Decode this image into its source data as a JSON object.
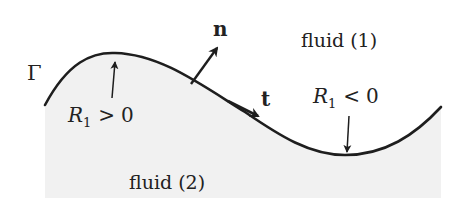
{
  "diagram": {
    "type": "interface-between-two-fluids",
    "colors": {
      "background": "#ffffff",
      "fluid2_fill": "#f1f1f1",
      "curve": "#1e1e1e",
      "text": "#222222"
    },
    "interface": {
      "label": "Γ"
    },
    "regions": {
      "upper": {
        "label": "fluid (1)"
      },
      "lower": {
        "label": "fluid (2)"
      }
    },
    "vectors": {
      "normal": {
        "label": "n"
      },
      "tangent": {
        "label": "t"
      }
    },
    "curvature": {
      "positive": {
        "symbol": "R",
        "subscript": "1",
        "relation": ">",
        "value": "0"
      },
      "negative": {
        "symbol": "R",
        "subscript": "1",
        "relation": "<",
        "value": "0"
      }
    }
  }
}
